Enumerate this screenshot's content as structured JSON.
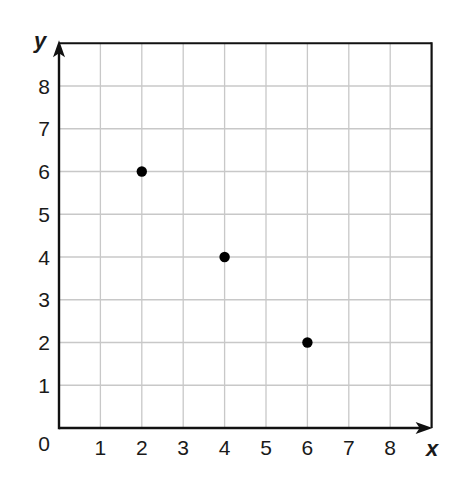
{
  "chart_data": {
    "type": "scatter",
    "title": "",
    "xlabel": "x",
    "ylabel": "y",
    "xlim": [
      0,
      9
    ],
    "ylim": [
      0,
      9
    ],
    "xticks": [
      1,
      2,
      3,
      4,
      5,
      6,
      7,
      8
    ],
    "yticks": [
      1,
      2,
      3,
      4,
      5,
      6,
      7,
      8
    ],
    "origin_label": "0",
    "grid": true,
    "legend": null,
    "series": [
      {
        "name": "points",
        "points": [
          {
            "x": 2,
            "y": 6
          },
          {
            "x": 4,
            "y": 4
          },
          {
            "x": 6,
            "y": 2
          }
        ]
      }
    ]
  },
  "colors": {
    "axis": "#111111",
    "grid": "#c8c8c8",
    "point": "#000000",
    "text": "#1a1a1a"
  }
}
